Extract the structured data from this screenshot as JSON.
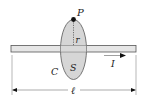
{
  "diagram": {
    "type": "physics-ampere-loop",
    "labels": {
      "point": "P",
      "radius": "r",
      "curve": "C",
      "surface": "S",
      "current": "I",
      "length": "ℓ"
    },
    "colors": {
      "wire_fill": "#e6e6e6",
      "wire_stroke": "#555555",
      "loop_fill": "#cfcfcf",
      "loop_stroke": "#666666",
      "ink": "#222222"
    }
  }
}
